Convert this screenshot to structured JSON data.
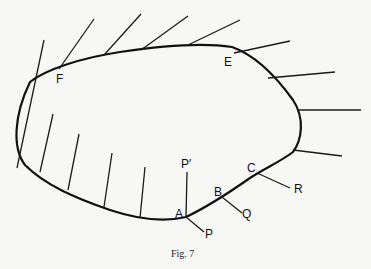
{
  "figure": {
    "caption": "Fig. 7",
    "labels": {
      "F": "F",
      "E": "E",
      "A": "A",
      "B": "B",
      "C": "C",
      "P": "P",
      "P_prime": "P′",
      "Q": "Q",
      "R": "R"
    },
    "colors": {
      "background": "#f7f7f5",
      "ink": "#111111"
    }
  }
}
